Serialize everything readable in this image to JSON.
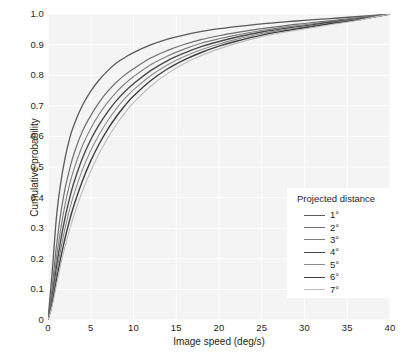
{
  "chart_data": {
    "type": "line",
    "title": "",
    "xlabel": "Image speed (deg/s)",
    "ylabel": "Cumulative probability",
    "xlim": [
      0,
      40
    ],
    "ylim": [
      0,
      1.0
    ],
    "xticks": [
      0,
      5,
      10,
      15,
      20,
      25,
      30,
      35,
      40
    ],
    "xtick_labels": [
      "0",
      "5",
      "10",
      "15",
      "20",
      "25",
      "30",
      "35",
      "40"
    ],
    "yticks": [
      0,
      0.1,
      0.2,
      0.3,
      0.4,
      0.5,
      0.6,
      0.7,
      0.8,
      0.9,
      1.0
    ],
    "ytick_labels": [
      "0",
      "0.1",
      "0.2",
      "0.3",
      "0.4",
      "0.5",
      "0.6",
      "0.7",
      "0.8",
      "0.9",
      "1.0"
    ],
    "grid": true,
    "grid_color": "#ffffff",
    "plot_background": "#f4f4f4",
    "legend_position": "lower right",
    "legend_title": "Projected distance",
    "x": [
      0,
      0.5,
      1,
      1.5,
      2,
      2.5,
      3,
      4,
      5,
      6,
      7,
      8,
      9,
      10,
      12,
      14,
      16,
      18,
      20,
      22,
      25,
      28,
      30,
      33,
      36,
      40
    ],
    "series": [
      {
        "name": "1°",
        "color": "#5a5a5a",
        "width": 1.3,
        "values": [
          0,
          0.16,
          0.34,
          0.45,
          0.53,
          0.59,
          0.635,
          0.7,
          0.748,
          0.785,
          0.815,
          0.84,
          0.858,
          0.874,
          0.899,
          0.918,
          0.932,
          0.943,
          0.952,
          0.959,
          0.968,
          0.975,
          0.979,
          0.985,
          0.991,
          1.0
        ]
      },
      {
        "name": "2°",
        "color": "#6e6e6e",
        "width": 1.2,
        "values": [
          0,
          0.11,
          0.245,
          0.35,
          0.43,
          0.49,
          0.54,
          0.615,
          0.668,
          0.712,
          0.748,
          0.777,
          0.801,
          0.821,
          0.856,
          0.881,
          0.901,
          0.917,
          0.929,
          0.939,
          0.952,
          0.963,
          0.969,
          0.978,
          0.987,
          1.0
        ]
      },
      {
        "name": "3°",
        "color": "#7f7f7f",
        "width": 1.1,
        "values": [
          0,
          0.09,
          0.205,
          0.3,
          0.378,
          0.44,
          0.49,
          0.568,
          0.626,
          0.673,
          0.712,
          0.745,
          0.772,
          0.795,
          0.834,
          0.863,
          0.886,
          0.905,
          0.919,
          0.931,
          0.946,
          0.958,
          0.965,
          0.975,
          0.985,
          1.0
        ]
      },
      {
        "name": "4°",
        "color": "#4a4a4a",
        "width": 1.4,
        "values": [
          0,
          0.075,
          0.175,
          0.262,
          0.335,
          0.395,
          0.446,
          0.527,
          0.589,
          0.639,
          0.681,
          0.717,
          0.747,
          0.772,
          0.815,
          0.848,
          0.873,
          0.894,
          0.91,
          0.924,
          0.941,
          0.954,
          0.961,
          0.973,
          0.983,
          1.0
        ]
      },
      {
        "name": "5°",
        "color": "#8c8c8c",
        "width": 1.1,
        "values": [
          0,
          0.065,
          0.152,
          0.232,
          0.3,
          0.358,
          0.408,
          0.489,
          0.554,
          0.607,
          0.652,
          0.691,
          0.724,
          0.752,
          0.798,
          0.834,
          0.862,
          0.884,
          0.902,
          0.917,
          0.936,
          0.95,
          0.958,
          0.97,
          0.982,
          1.0
        ]
      },
      {
        "name": "6°",
        "color": "#3d3d3d",
        "width": 1.4,
        "values": [
          0,
          0.055,
          0.132,
          0.205,
          0.268,
          0.323,
          0.372,
          0.453,
          0.52,
          0.576,
          0.624,
          0.665,
          0.701,
          0.732,
          0.782,
          0.821,
          0.851,
          0.875,
          0.895,
          0.911,
          0.931,
          0.946,
          0.955,
          0.968,
          0.98,
          1.0
        ]
      },
      {
        "name": "7°",
        "color": "#bdbdbd",
        "width": 1.1,
        "values": [
          0,
          0.048,
          0.116,
          0.182,
          0.24,
          0.292,
          0.339,
          0.419,
          0.487,
          0.545,
          0.595,
          0.639,
          0.677,
          0.71,
          0.764,
          0.806,
          0.839,
          0.865,
          0.886,
          0.904,
          0.926,
          0.942,
          0.951,
          0.965,
          0.978,
          1.0
        ]
      }
    ]
  },
  "axes": {
    "x_title": "Image speed (deg/s)",
    "y_title": "Cumulative probability",
    "x_tick_labels": [
      "0",
      "5",
      "10",
      "15",
      "20",
      "25",
      "30",
      "35",
      "40"
    ],
    "y_tick_labels": [
      "1.0",
      "0.9",
      "0.8",
      "0.7",
      "0.6",
      "0.5",
      "0.4",
      "0.3",
      "0.2",
      "0.1",
      "0"
    ]
  },
  "legend": {
    "title": "Projected distance",
    "items": [
      {
        "label": "1°",
        "color": "#5a5a5a",
        "width": "1.3px"
      },
      {
        "label": "2°",
        "color": "#6e6e6e",
        "width": "1.2px"
      },
      {
        "label": "3°",
        "color": "#7f7f7f",
        "width": "1.1px"
      },
      {
        "label": "4°",
        "color": "#4a4a4a",
        "width": "1.5px"
      },
      {
        "label": "5°",
        "color": "#8c8c8c",
        "width": "1.1px"
      },
      {
        "label": "6°",
        "color": "#3d3d3d",
        "width": "1.5px"
      },
      {
        "label": "7°",
        "color": "#bdbdbd",
        "width": "1.1px"
      }
    ]
  }
}
